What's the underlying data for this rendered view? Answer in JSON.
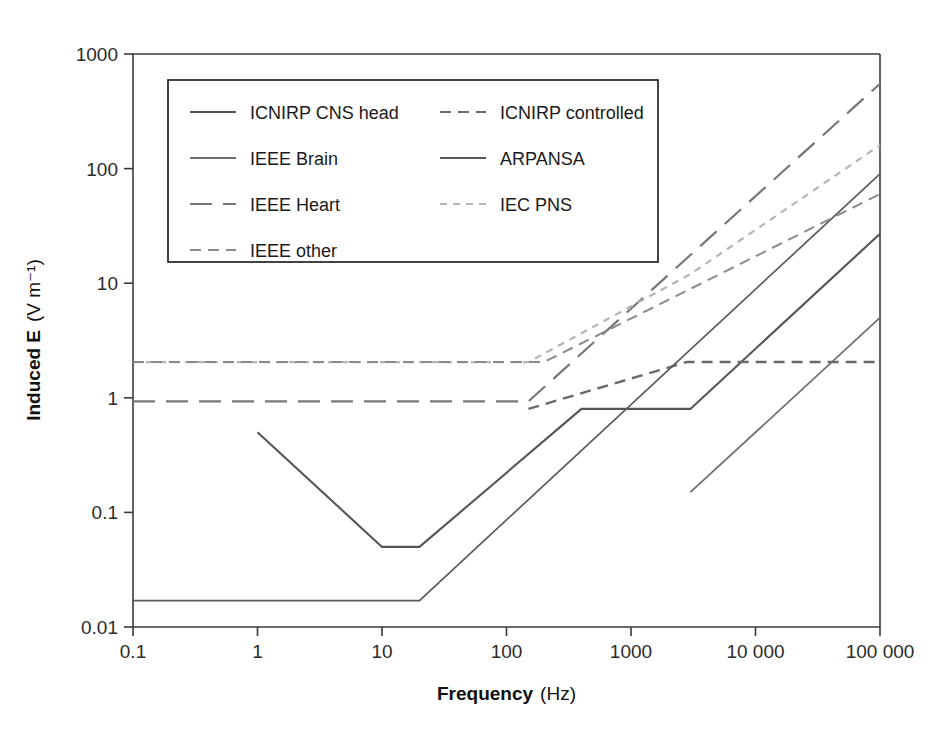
{
  "chart_data": {
    "type": "line",
    "title": "",
    "xlabel": "Frequency",
    "xunit": "(Hz)",
    "ylabel": "Induced E",
    "yunit": "(V m⁻¹)",
    "xscale": "log",
    "yscale": "log",
    "xlim": [
      0.1,
      100000
    ],
    "ylim": [
      0.01,
      1000
    ],
    "grid": false,
    "xticks": [
      "0.1",
      "1",
      "10",
      "100",
      "1000",
      "10 000",
      "100 000"
    ],
    "xtick_values": [
      0.1,
      1,
      10,
      100,
      1000,
      10000,
      100000
    ],
    "yticks": [
      "1000",
      "100",
      "10",
      "1",
      "0.1",
      "0.01"
    ],
    "ytick_values": [
      1000,
      100,
      10,
      1,
      0.1,
      0.01
    ],
    "legend_position": "upper-left-inside",
    "series": [
      {
        "name": "ICNIRP CNS head",
        "style": "solid",
        "color": "#555555",
        "width": 2.1,
        "points": [
          [
            1,
            0.5
          ],
          [
            10,
            0.05
          ],
          [
            20,
            0.05
          ],
          [
            400,
            0.8
          ],
          [
            3000,
            0.8
          ],
          [
            100000,
            27
          ]
        ]
      },
      {
        "name": "ICNIRP controlled",
        "style": "dashed",
        "color": "#6a6a6a",
        "width": 2.4,
        "points": [
          [
            150,
            0.8
          ],
          [
            2800,
            2.05
          ],
          [
            100000,
            2.05
          ]
        ]
      },
      {
        "name": "IEEE Brain",
        "style": "solid",
        "color": "#6e6e6e",
        "width": 1.7,
        "points": [
          [
            3000,
            0.15
          ],
          [
            100000,
            5.0
          ]
        ]
      },
      {
        "name": "ARPANSA",
        "style": "solid",
        "color": "#5a5a5a",
        "width": 1.7,
        "points": [
          [
            0.1,
            0.017
          ],
          [
            20,
            0.017
          ],
          [
            100000,
            90
          ]
        ]
      },
      {
        "name": "IEEE Heart",
        "style": "long-dash",
        "color": "#777777",
        "width": 2.2,
        "points": [
          [
            0.1,
            0.93
          ],
          [
            150,
            0.93
          ],
          [
            100000,
            550
          ]
        ]
      },
      {
        "name": "IEC PNS",
        "style": "short-dash",
        "color": "#b5b5b5",
        "width": 2.2,
        "points": [
          [
            0.1,
            2.05
          ],
          [
            150,
            2.05
          ],
          [
            3000,
            12
          ],
          [
            100000,
            160
          ]
        ]
      },
      {
        "name": "IEEE other",
        "style": "dashed",
        "color": "#8a8a8a",
        "width": 2.0,
        "points": [
          [
            0.1,
            2.05
          ],
          [
            200,
            2.05
          ],
          [
            100000,
            60
          ]
        ]
      }
    ]
  },
  "legend": {
    "entries": [
      {
        "label": "ICNIRP CNS head",
        "style": "solid",
        "color": "#555555"
      },
      {
        "label": "ICNIRP controlled",
        "style": "dashed",
        "color": "#6a6a6a"
      },
      {
        "label": "IEEE Brain",
        "style": "solid",
        "color": "#6e6e6e"
      },
      {
        "label": "ARPANSA",
        "style": "solid",
        "color": "#5a5a5a"
      },
      {
        "label": "IEEE Heart",
        "style": "long-dash",
        "color": "#777777"
      },
      {
        "label": "IEC PNS",
        "style": "short-dash",
        "color": "#b5b5b5"
      },
      {
        "label": "IEEE other",
        "style": "dashed",
        "color": "#8a8a8a"
      }
    ]
  },
  "axes": {
    "x_label_main": "Frequency",
    "x_label_unit": "(Hz)",
    "y_label_main": "Induced E",
    "y_label_unit": "(V m⁻¹)"
  },
  "colors": {
    "axis": "#3a3a3a",
    "background": "#ffffff",
    "legend_border": "#222222"
  }
}
